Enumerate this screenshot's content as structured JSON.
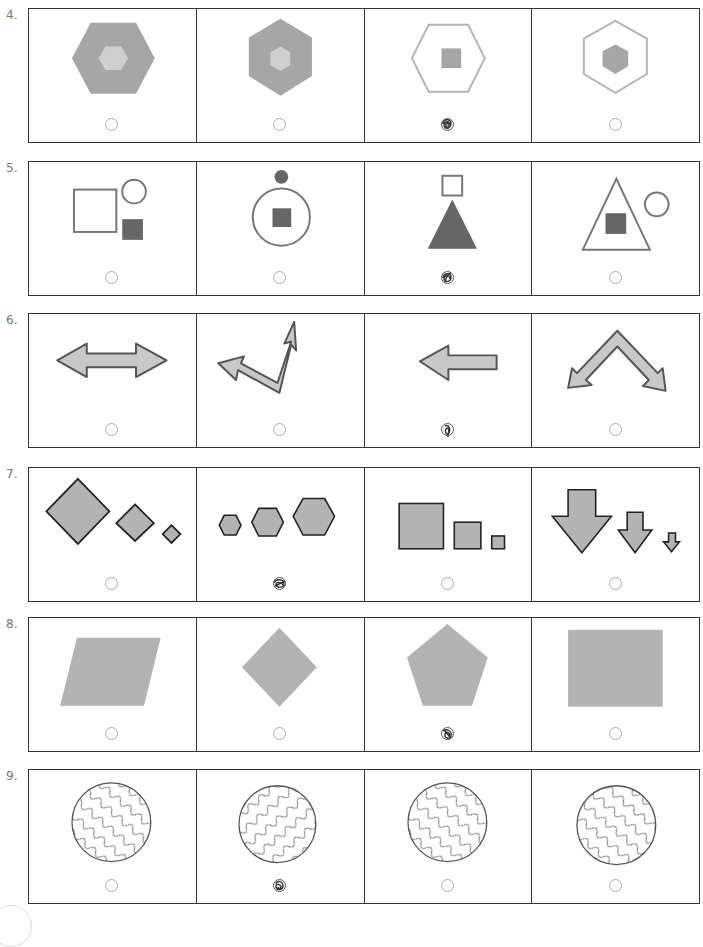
{
  "worksheet": {
    "questions": [
      {
        "number": "4.",
        "options": [
          {
            "figure": "large gray hexagon (flat-top) with small light-gray hexagon inside",
            "marked": false
          },
          {
            "figure": "gray hexagon (pointy-top) with small light-gray hexagon inside",
            "marked": false
          },
          {
            "figure": "outlined hexagon with small gray square inside",
            "marked": true
          },
          {
            "figure": "outlined hexagon (pointy-top) with small gray hexagon inside",
            "marked": false
          }
        ]
      },
      {
        "number": "5.",
        "options": [
          {
            "figure": "outlined square, outlined circle, filled dark square",
            "marked": false
          },
          {
            "figure": "filled dot above outlined circle containing filled square",
            "marked": false
          },
          {
            "figure": "outlined square above filled triangle",
            "marked": true
          },
          {
            "figure": "outlined triangle containing filled square, outlined circle",
            "marked": false
          }
        ]
      },
      {
        "number": "6.",
        "options": [
          {
            "figure": "double-headed horizontal arrow",
            "marked": false
          },
          {
            "figure": "bent arrow with heads pointing left and up-right",
            "marked": false
          },
          {
            "figure": "left-pointing arrow",
            "marked": true
          },
          {
            "figure": "inverted V arrow with heads pointing down-left and down-right",
            "marked": false
          }
        ]
      },
      {
        "number": "7.",
        "options": [
          {
            "figure": "three diamonds decreasing in size",
            "marked": false
          },
          {
            "figure": "three hexagons increasing in size",
            "marked": true
          },
          {
            "figure": "three squares decreasing in size",
            "marked": false
          },
          {
            "figure": "three down arrows decreasing in size",
            "marked": false
          }
        ]
      },
      {
        "number": "8.",
        "options": [
          {
            "figure": "gray parallelogram",
            "marked": false
          },
          {
            "figure": "gray diamond",
            "marked": false
          },
          {
            "figure": "gray pentagon",
            "marked": true
          },
          {
            "figure": "gray rectangle",
            "marked": false
          }
        ]
      },
      {
        "number": "9.",
        "options": [
          {
            "figure": "circle with wavy lines (down-right direction)",
            "marked": false
          },
          {
            "figure": "circle with wavy lines (up-right direction)",
            "marked": true
          },
          {
            "figure": "circle with wavy lines (down-right direction)",
            "marked": false
          },
          {
            "figure": "circle with wavy lines (down-right direction)",
            "marked": false
          }
        ]
      }
    ],
    "colors": {
      "border": "#333333",
      "fill_mid": "#a6a6a6",
      "fill_light": "#cccccc",
      "fill_dark": "#666666",
      "outline": "#888888",
      "bubble": "#aaaaaa"
    }
  }
}
